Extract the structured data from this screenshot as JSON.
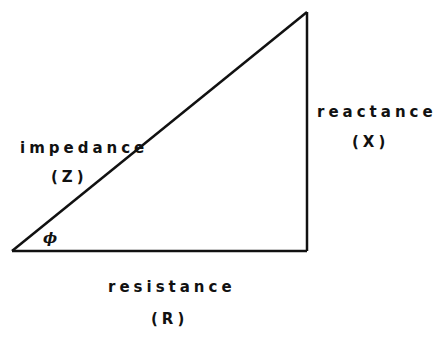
{
  "diagram": {
    "type": "impedance-triangle",
    "hypotenuse": {
      "name": "impedance",
      "symbol": "(Z)"
    },
    "vertical_side": {
      "name": "reactance",
      "symbol": "(X)"
    },
    "horizontal_side": {
      "name": "resistance",
      "symbol": "(R)"
    },
    "angle_symbol": "ϕ",
    "vertices": {
      "bottom_left": [
        12,
        251
      ],
      "top_right": [
        307,
        12
      ],
      "bottom_right": [
        307,
        251
      ]
    },
    "stroke_color": "#111111"
  }
}
